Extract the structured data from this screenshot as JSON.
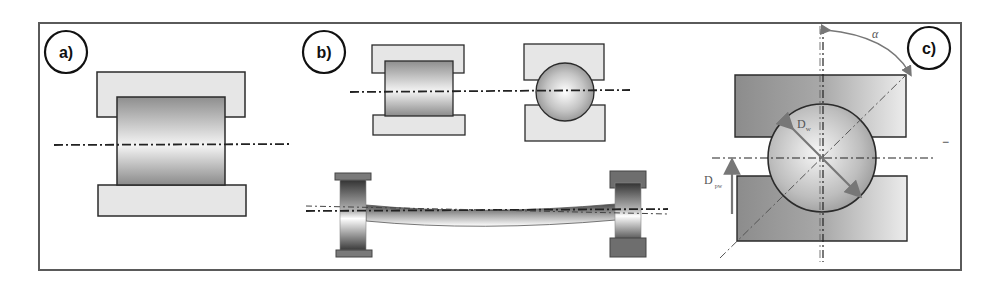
{
  "figure": {
    "colors": {
      "frame": "#5a5a5a",
      "ring_light": "#e6e6e6",
      "ring_dark": "#8a8a8a",
      "outline": "#2b2b2b",
      "axis_line": "#222222",
      "arrow": "#777777"
    }
  },
  "panels": {
    "a": {
      "label": "a)",
      "content": "Cylindrical roller between two raceway rings, horizontal center axis"
    },
    "b": {
      "label": "b)",
      "content": "Cylindrical roller and ball between rings; lower view shows shaft deflection between two bearings"
    },
    "c": {
      "label": "c)",
      "content": "Angular contact ball with contact angle and ball diameter",
      "annotations": {
        "alpha": "α",
        "ball_diameter_main": "D",
        "ball_diameter_sub": "w",
        "pitch_diameter_main": "D",
        "pitch_diameter_sub": "pw",
        "side_mark": "−"
      }
    }
  }
}
